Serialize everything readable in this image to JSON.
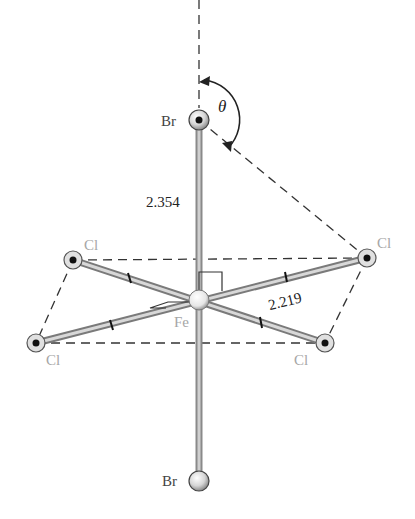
{
  "diagram": {
    "atoms": {
      "br_top": {
        "label": "Br",
        "x": 199,
        "y": 120
      },
      "fe": {
        "label": "Fe",
        "x": 199,
        "y": 300
      },
      "br_bottom": {
        "label": "Br",
        "x": 199,
        "y": 481
      },
      "cl_ul": {
        "label": "Cl",
        "x": 73,
        "y": 260
      },
      "cl_ur": {
        "label": "Cl",
        "x": 367,
        "y": 258
      },
      "cl_ll": {
        "label": "Cl",
        "x": 36,
        "y": 343
      },
      "cl_lr": {
        "label": "Cl",
        "x": 325,
        "y": 343
      }
    },
    "bond_lengths": {
      "fe_br": "2.354",
      "fe_cl": "2.219"
    },
    "angle_label": "θ",
    "colors": {
      "bond": "#7a7a7a",
      "atom_fill": "#d9d9d9",
      "label_gray": "#a6a6a6",
      "dashed": "#333333"
    }
  }
}
